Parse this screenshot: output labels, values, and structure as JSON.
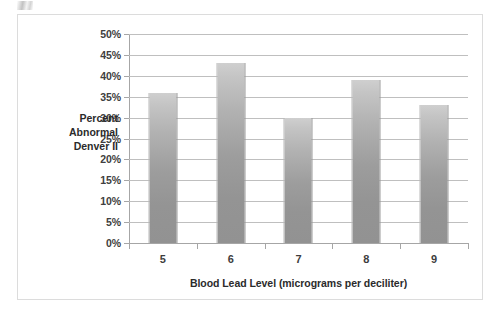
{
  "chart_data": {
    "type": "bar",
    "title": "",
    "categories": [
      "5",
      "6",
      "7",
      "8",
      "9"
    ],
    "values": [
      36,
      43,
      30,
      39,
      33
    ],
    "value_labels": [
      "36%",
      "43%",
      "30%",
      "39%",
      "33%"
    ],
    "xlabel": "Blood Lead Level (micrograms per deciliter)",
    "ylabel": "Percent Abnormal Denver II",
    "ylabel_lines": [
      "Percent",
      "Abnormal",
      "Denver II"
    ],
    "ylim": [
      0,
      50
    ],
    "ytick_values": [
      0,
      5,
      10,
      15,
      20,
      25,
      30,
      35,
      40,
      45,
      50
    ],
    "ytick_labels": [
      "0%",
      "5%",
      "10%",
      "15%",
      "20%",
      "25%",
      "30%",
      "35%",
      "40%",
      "45%",
      "50%"
    ],
    "grid": true,
    "legend": "none",
    "bar_color": "#a8a8a8",
    "gridline_color": "#bfbfbf",
    "axis_color": "#a6a6a6",
    "frame_color": "#dcdcdc",
    "background": "#ffffff"
  }
}
